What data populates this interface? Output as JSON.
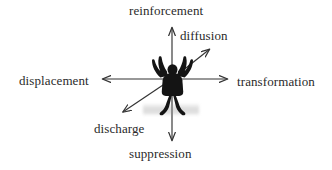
{
  "diagram": {
    "background_color": "#ffffff",
    "line_color": "#333333",
    "text_color": "#2a2a2a",
    "center": {
      "x": 172,
      "y": 79
    },
    "figure": {
      "name": "human-silhouette",
      "description": "dark silhouette of a person standing with arms raised upward and outward",
      "color": "#1a1a1a",
      "shadow_color": "#969696"
    },
    "axes": [
      {
        "id": "reinforcement",
        "label": "reinforcement",
        "direction": "up",
        "tip": {
          "x": 172,
          "y": 25
        }
      },
      {
        "id": "diffusion",
        "label": "diffusion",
        "direction": "up-right",
        "tip": {
          "x": 212,
          "y": 47
        }
      },
      {
        "id": "transformation",
        "label": "transformation",
        "direction": "right",
        "tip": {
          "x": 230,
          "y": 79
        }
      },
      {
        "id": "suppression",
        "label": "suppression",
        "direction": "down",
        "tip": {
          "x": 172,
          "y": 143
        }
      },
      {
        "id": "discharge",
        "label": "discharge",
        "direction": "down-left",
        "tip": {
          "x": 120,
          "y": 114
        }
      },
      {
        "id": "displacement",
        "label": "displacement",
        "direction": "left",
        "tip": {
          "x": 100,
          "y": 79
        }
      }
    ]
  }
}
